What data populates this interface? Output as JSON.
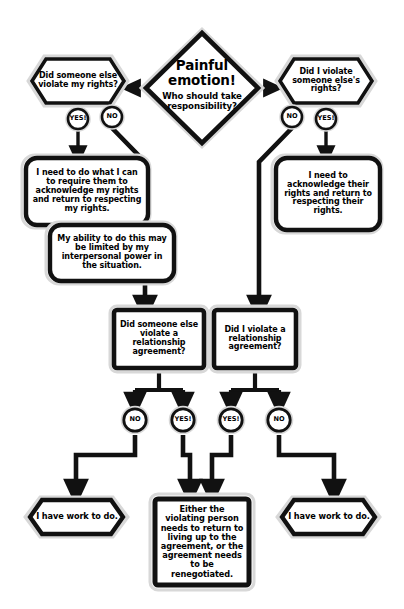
{
  "diagram": {
    "colors": {
      "ink": "#111111",
      "background": "#ffffff",
      "shadow": "#d8d8d8",
      "fill": "#ffffff"
    },
    "root": {
      "line1": "Painful",
      "line2": "emotion!",
      "line3": "Who should take",
      "line4": "responsibility?"
    },
    "branch_left": {
      "question": "Did someone else violate my rights?",
      "answer_yes": "YES!",
      "answer_no": "NO",
      "outcome": "I need to do what I can to require them to acknowledge my rights and return to respecting my rights.",
      "note": "My ability to do this may be limited by my interpersonal power in the situation."
    },
    "branch_right": {
      "question": "Did I violate someone else's rights?",
      "answer_no": "NO",
      "answer_yes": "YES!",
      "outcome": "I need to acknowledge their rights and return to respecting their rights."
    },
    "mid_left": {
      "question": "Did someone else violate a relationship agreement?",
      "answer_no": "NO",
      "answer_yes": "YES!"
    },
    "mid_right": {
      "question": "Did I violate a relationship agreement?",
      "answer_yes": "YES!",
      "answer_no": "NO"
    },
    "final_left": "I have work to do.",
    "final_center": "Either the violating person needs to return to living up to the agreement, or the agreement needs to be renegotiated.",
    "final_right": "I have work to do."
  }
}
